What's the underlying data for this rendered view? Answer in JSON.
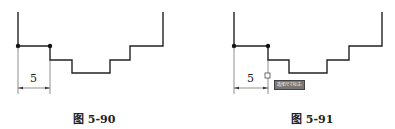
{
  "figures": [
    {
      "caption": "图 5-90",
      "dimension_label": "5"
    },
    {
      "caption": "图 5-91",
      "dimension_label": "5",
      "tooltip": "选择尺寸标注:"
    }
  ]
}
